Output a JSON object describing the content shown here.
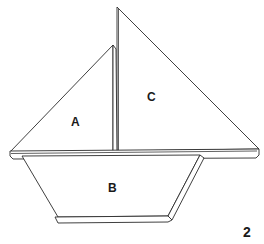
{
  "figure": {
    "pieces": [
      {
        "id": "sail-a",
        "label": "A"
      },
      {
        "id": "hull-b",
        "label": "B"
      },
      {
        "id": "sail-c",
        "label": "C"
      }
    ],
    "figure_number": "2"
  }
}
